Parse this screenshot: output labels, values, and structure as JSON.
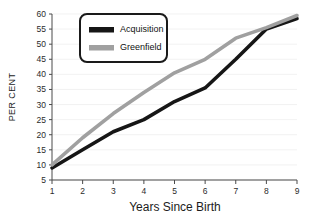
{
  "chart_data": {
    "type": "line",
    "title": "",
    "xlabel": "Years Since Birth",
    "ylabel": "PER CENT",
    "x": [
      1,
      2,
      3,
      4,
      5,
      6,
      7,
      8,
      9
    ],
    "xticklabels": [
      "1",
      "2",
      "3",
      "4",
      "5",
      "6",
      "7",
      "8",
      "9"
    ],
    "yticklabels": [
      "5",
      "10",
      "15",
      "20",
      "25",
      "30",
      "35",
      "40",
      "45",
      "50",
      "55",
      "60"
    ],
    "yticks": [
      5,
      10,
      15,
      20,
      25,
      30,
      35,
      40,
      45,
      50,
      55,
      60
    ],
    "xlim": [
      1,
      9
    ],
    "ylim": [
      5,
      60
    ],
    "grid": true,
    "legend_position": "upper-left",
    "series": [
      {
        "name": "Acquisition",
        "color": "#161616",
        "values": [
          9,
          15,
          21,
          25,
          31,
          35.5,
          45,
          55,
          58.5
        ]
      },
      {
        "name": "Greenfield",
        "color": "#a0a0a0",
        "values": [
          10,
          19,
          27,
          34,
          40.5,
          45,
          52,
          55.5,
          59.5
        ]
      }
    ]
  },
  "legend": {
    "items": [
      {
        "label": "Acquisition",
        "swatch_color": "#161616"
      },
      {
        "label": "Greenfield",
        "swatch_color": "#a0a0a0"
      }
    ]
  },
  "axes": {
    "x_title": "Years Since Birth",
    "y_title": "PER CENT"
  }
}
